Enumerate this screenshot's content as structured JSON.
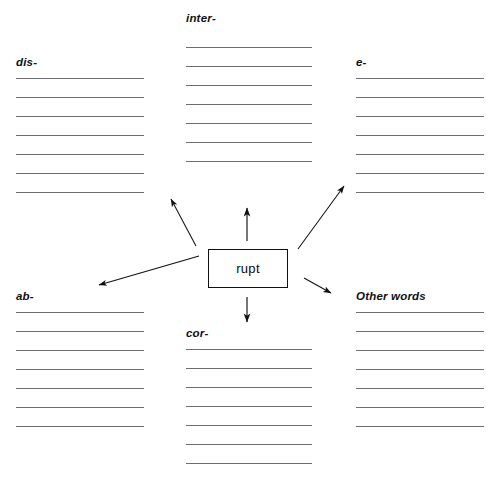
{
  "worksheet": {
    "root_word": "rupt",
    "line_count_per_section": 7,
    "line_color": "#6e6e6e",
    "box_border_color": "#111111",
    "background_color": "#ffffff",
    "text_color": "#101010"
  },
  "sections": [
    {
      "id": "dis",
      "label": "dis-",
      "position": "top-left"
    },
    {
      "id": "inter",
      "label": "inter-",
      "position": "top-center"
    },
    {
      "id": "e",
      "label": "e-",
      "position": "top-right"
    },
    {
      "id": "ab",
      "label": "ab-",
      "position": "bottom-left"
    },
    {
      "id": "cor",
      "label": "cor-",
      "position": "bottom-center"
    },
    {
      "id": "other",
      "label": "Other words",
      "position": "bottom-right"
    }
  ],
  "arrows": [
    {
      "id": "arrow-to-dis",
      "from": "root-box",
      "to": "dis",
      "direction": "up-left"
    },
    {
      "id": "arrow-to-inter",
      "from": "root-box",
      "to": "inter",
      "direction": "up"
    },
    {
      "id": "arrow-to-e",
      "from": "root-box",
      "to": "e",
      "direction": "up-right"
    },
    {
      "id": "arrow-to-ab",
      "from": "root-box",
      "to": "ab",
      "direction": "left-down"
    },
    {
      "id": "arrow-to-cor",
      "from": "root-box",
      "to": "cor",
      "direction": "down"
    },
    {
      "id": "arrow-to-other",
      "from": "root-box",
      "to": "other",
      "direction": "down-right"
    }
  ]
}
